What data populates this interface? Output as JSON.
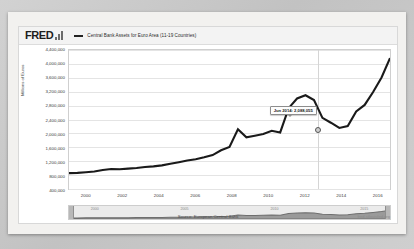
{
  "header": {
    "logo_text": "FRED",
    "logo_mark": "bar-chart-mark",
    "legend_label": "Central Bank Assets for Euro Area (11-19 Countries)"
  },
  "axis": {
    "ylabel": "Millions of Euros",
    "yticks": [
      "4,400,000",
      "4,000,000",
      "3,600,000",
      "3,200,000",
      "2,800,000",
      "2,400,000",
      "2,000,000",
      "1,600,000",
      "1,200,000",
      "800,000",
      "400,000"
    ],
    "xticks": [
      "2000",
      "2002",
      "2004",
      "2006",
      "2008",
      "2010",
      "2012",
      "2014",
      "2016"
    ]
  },
  "tooltip": {
    "text": "Jun 2014: 2,088,055",
    "date": "Jun 2014",
    "value": "2,088,055"
  },
  "navigator": {
    "left_handle": "range-start-handle",
    "right_handle": "range-end-handle",
    "ticks": [
      "2000",
      "2005",
      "2010",
      "2015"
    ]
  },
  "footer": {
    "source": "Source: European Central Bank",
    "attribution": "fred.stlouisfed.org"
  },
  "colors": {
    "line": "#1a1a1a",
    "grid": "#e4e4e4",
    "plot_bg": "#ffffff",
    "card_bg": "#ffffff",
    "page_bg": "#cccccc"
  },
  "chart_data": {
    "type": "line",
    "title": "Central Bank Assets for Euro Area (11-19 Countries)",
    "xlabel": "",
    "ylabel": "Millions of Euros",
    "ylim": [
      200000,
      4500000
    ],
    "xlim": [
      "1999-01",
      "2017-06"
    ],
    "grid": true,
    "legend_position": "top",
    "annotation": {
      "x": "2014-06",
      "y": 2088055,
      "label": "Jun 2014: 2,088,055"
    },
    "source": "Source: European Central Bank",
    "series": [
      {
        "name": "Central Bank Assets for Euro Area (11-19 Countries)",
        "x": [
          "1999-01",
          "1999-07",
          "2000-01",
          "2000-07",
          "2001-01",
          "2001-07",
          "2002-01",
          "2002-07",
          "2003-01",
          "2003-07",
          "2004-01",
          "2004-07",
          "2005-01",
          "2005-07",
          "2006-01",
          "2006-07",
          "2007-01",
          "2007-07",
          "2008-01",
          "2008-07",
          "2008-12",
          "2009-06",
          "2009-12",
          "2010-06",
          "2010-12",
          "2011-06",
          "2011-12",
          "2012-03",
          "2012-06",
          "2012-12",
          "2013-06",
          "2013-12",
          "2014-06",
          "2014-12",
          "2015-06",
          "2015-12",
          "2016-06",
          "2016-12",
          "2017-06"
        ],
        "values": [
          690000,
          700000,
          720000,
          740000,
          790000,
          820000,
          810000,
          830000,
          850000,
          880000,
          900000,
          930000,
          980000,
          1030000,
          1080000,
          1120000,
          1180000,
          1250000,
          1400000,
          1500000,
          2050000,
          1800000,
          1850000,
          1900000,
          2000000,
          1950000,
          2700000,
          3000000,
          3100000,
          2950000,
          2400000,
          2250000,
          2088055,
          2150000,
          2600000,
          2800000,
          3200000,
          3650000,
          4250000
        ]
      }
    ]
  }
}
